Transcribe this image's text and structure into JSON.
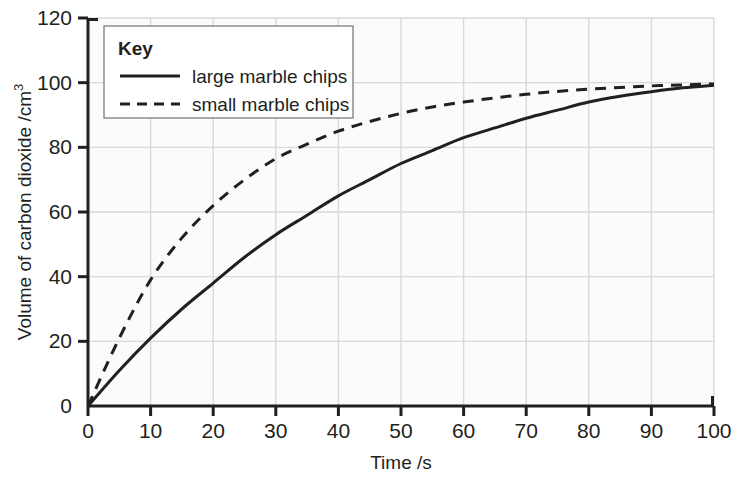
{
  "chart_data": {
    "type": "line",
    "title": "",
    "xlabel": "Time /s",
    "ylabel": "Volume of carbon dioxide /cm",
    "ylabel_superscript": "3",
    "xlim": [
      0,
      100
    ],
    "ylim": [
      0,
      120
    ],
    "xticks": [
      "0",
      "10",
      "20",
      "30",
      "40",
      "50",
      "60",
      "70",
      "80",
      "90",
      "100"
    ],
    "yticks": [
      "0",
      "20",
      "40",
      "60",
      "80",
      "100",
      "120"
    ],
    "xtick_values": [
      0,
      10,
      20,
      30,
      40,
      50,
      60,
      70,
      80,
      90,
      100
    ],
    "ytick_values": [
      0,
      20,
      40,
      60,
      80,
      100,
      120
    ],
    "grid": true,
    "grid_color": "#d9d9d9",
    "plot_background": "#fbfbfb",
    "axis_color": "#231f20",
    "legend_position": "upper-left",
    "x": [
      0,
      5,
      10,
      15,
      20,
      25,
      30,
      35,
      40,
      45,
      50,
      55,
      60,
      65,
      70,
      75,
      80,
      85,
      90,
      95,
      100
    ],
    "series": [
      {
        "name": "large marble chips",
        "style": "solid",
        "color": "#231f20",
        "values": [
          0,
          11,
          21,
          30,
          38,
          46,
          53,
          59,
          65,
          70,
          75,
          79,
          83,
          86,
          89,
          91.5,
          94,
          95.8,
          97.2,
          98.4,
          99.2
        ]
      },
      {
        "name": "small marble chips",
        "style": "dashed",
        "color": "#231f20",
        "values": [
          0,
          21,
          39,
          52,
          62,
          70,
          76.5,
          81,
          85,
          88,
          90.5,
          92.5,
          94,
          95.3,
          96.4,
          97.3,
          98,
          98.5,
          99,
          99.3,
          99.6
        ]
      }
    ]
  },
  "legend": {
    "title": "Key",
    "entries": [
      {
        "label": "large marble chips",
        "style": "solid"
      },
      {
        "label": "small marble chips",
        "style": "dashed"
      }
    ]
  }
}
